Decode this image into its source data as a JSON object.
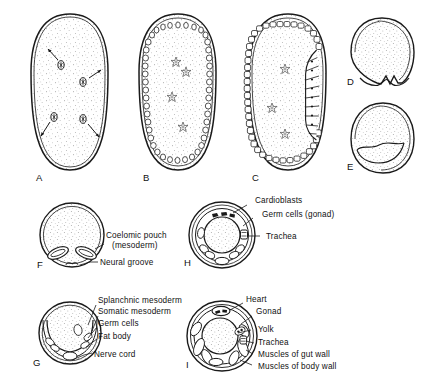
{
  "figure": {
    "background": "#ffffff",
    "ink": "#1a1a1a"
  },
  "panels": [
    {
      "id": "A",
      "letter": "A",
      "stage": "cleavage-nuclei-migrating",
      "description": "Oval egg with yolk stipple and cleavage nuclei migrating outward (arrows)",
      "nuclei_count": 4
    },
    {
      "id": "B",
      "letter": "B",
      "stage": "syncytial-blastoderm",
      "description": "Nuclei reached periphery forming blastoderm ring; vitellophages in yolk"
    },
    {
      "id": "C",
      "letter": "C",
      "stage": "cellular-blastoderm-germ-band",
      "description": "Cellular blastoderm with thickened germ band on ventral side"
    },
    {
      "id": "D",
      "letter": "D",
      "stage": "gastrulation-ventral-furrow",
      "description": "Cross section, ventral furrow invagination"
    },
    {
      "id": "E",
      "letter": "E",
      "stage": "mesoderm-internalized",
      "description": "Cross section, mesoderm layer internalized beneath ectoderm"
    },
    {
      "id": "F",
      "letter": "F",
      "stage": "coelomic-pouches",
      "description": "Cross section with paired coelomic pouches and neural groove",
      "labels": [
        {
          "text": "Coelomic pouch",
          "name": "coelomic-pouch"
        },
        {
          "text": "(mesoderm)",
          "name": "mesoderm-parenthetical"
        },
        {
          "text": "Neural groove",
          "name": "neural-groove"
        }
      ]
    },
    {
      "id": "G",
      "letter": "G",
      "stage": "mesoderm-differentiation",
      "description": "Cross section showing splanchnic and somatic mesoderm, germ cells, fat body, nerve cord",
      "labels": [
        {
          "text": "Splanchnic mesoderm",
          "name": "splanchnic-mesoderm"
        },
        {
          "text": "Somatic mesoderm",
          "name": "somatic-mesoderm"
        },
        {
          "text": "Germ cells",
          "name": "germ-cells"
        },
        {
          "text": "Fat body",
          "name": "fat-body"
        },
        {
          "text": "Nerve cord",
          "name": "nerve-cord"
        }
      ]
    },
    {
      "id": "H",
      "letter": "H",
      "stage": "organ-rudiments",
      "description": "Cross section with cardioblasts, germ cells (gonad) and trachea",
      "labels": [
        {
          "text": "Cardioblasts",
          "name": "cardioblasts"
        },
        {
          "text": "Germ cells (gonad)",
          "name": "germ-cells-gonad"
        },
        {
          "text": "Trachea",
          "name": "trachea"
        }
      ]
    },
    {
      "id": "I",
      "letter": "I",
      "stage": "differentiated-larva",
      "description": "Cross section of differentiated embryo with heart, gonad, yolk, trachea and muscle layers",
      "labels": [
        {
          "text": "Heart",
          "name": "heart"
        },
        {
          "text": "Gonad",
          "name": "gonad"
        },
        {
          "text": "Yolk",
          "name": "yolk"
        },
        {
          "text": "Trachea",
          "name": "trachea"
        },
        {
          "text": "Muscles of gut wall",
          "name": "muscles-of-gut-wall"
        },
        {
          "text": "Muscles of body wall",
          "name": "muscles-of-body-wall"
        }
      ]
    }
  ]
}
